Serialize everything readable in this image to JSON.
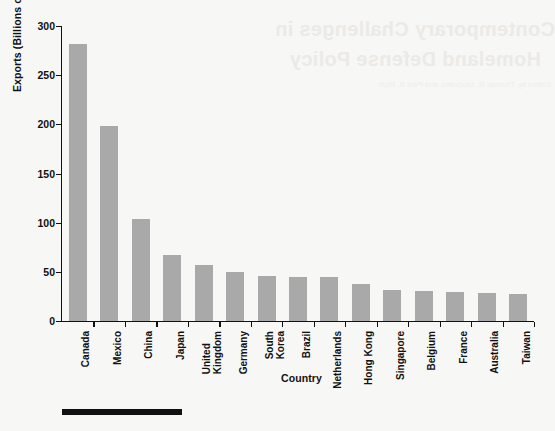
{
  "page": {
    "background_color": "#f7f7f5",
    "bleed_through_text": {
      "line1": "Contemporary Challenges in",
      "line2": "Homeland Defense Policy",
      "line3": "Edited by Thomas R. Mockaitis and Paul B. Rich"
    },
    "rule_color": "#111111"
  },
  "chart_data": {
    "type": "bar",
    "title": "",
    "xlabel": "Country",
    "ylabel": "Exports (Billions of Dollars)",
    "ylim": [
      0,
      300
    ],
    "yticks": [
      0,
      50,
      100,
      150,
      200,
      250,
      300
    ],
    "ytick_labels": [
      "0",
      "50",
      "100",
      "150",
      "200",
      "250",
      "300"
    ],
    "grid": false,
    "legend": false,
    "bar_color": "#a9a9a9",
    "axis_color": "#111111",
    "categories": [
      "Canada",
      "Mexico",
      "China",
      "Japan",
      "United Kingdom",
      "Germany",
      "South Korea",
      "Brazil",
      "Netherlands",
      "Hong Kong",
      "Singapore",
      "Belgium",
      "France",
      "Australia",
      "Taiwan"
    ],
    "category_lines": [
      [
        "Canada"
      ],
      [
        "Mexico"
      ],
      [
        "China"
      ],
      [
        "Japan"
      ],
      [
        "United",
        "Kingdom"
      ],
      [
        "Germany"
      ],
      [
        "South",
        "Korea"
      ],
      [
        "Brazil"
      ],
      [
        "Netherlands"
      ],
      [
        "Hong Kong"
      ],
      [
        "Singapore"
      ],
      [
        "Belgium"
      ],
      [
        "France"
      ],
      [
        "Australia"
      ],
      [
        "Taiwan"
      ]
    ],
    "values": [
      282,
      198,
      104,
      67,
      57,
      50,
      46,
      45,
      45,
      38,
      32,
      31,
      29,
      28,
      27
    ]
  }
}
